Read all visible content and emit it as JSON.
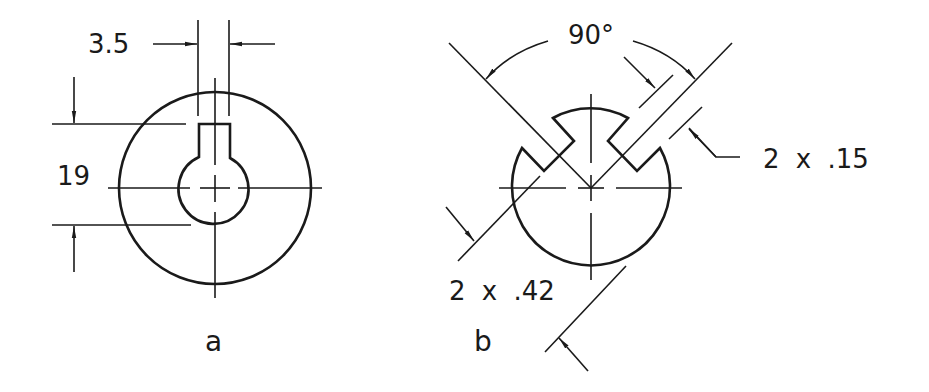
{
  "colors": {
    "ink": "#1a1a1a",
    "background": "#ffffff"
  },
  "figures": [
    {
      "id": "a",
      "label": "a",
      "description": "Hub with keyway",
      "dimensions": {
        "keyway_width": "3.5",
        "hub_height": "19"
      }
    },
    {
      "id": "b",
      "label": "b",
      "description": "Shaft with two dovetail keyways at 90 degrees",
      "dimensions": {
        "angle": "90°",
        "slot_width": "2 x .15",
        "slot_offset": "2 x .42"
      }
    }
  ]
}
